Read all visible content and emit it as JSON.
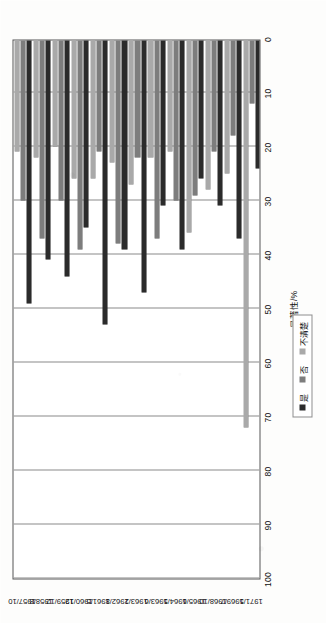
{
  "chart_data": {
    "type": "bar",
    "orientation": "horizontal",
    "title": "",
    "xlabel": "显著性/%",
    "ylabel": "",
    "ylim": [
      0,
      100
    ],
    "grid": true,
    "legend_position": "bottom-right",
    "categories": [
      "1957/10",
      "1958/8",
      "1959/12",
      "1960/12",
      "1961/5",
      "1962/8",
      "1963/2",
      "1963/6",
      "1964/5",
      "1965/6",
      "1968/10",
      "1969/7",
      "1971/5"
    ],
    "series": [
      {
        "name": "是",
        "color": "#2b2b2b",
        "values": [
          49,
          41,
          44,
          35,
          53,
          39,
          47,
          31,
          39,
          26,
          31,
          37,
          24
        ]
      },
      {
        "name": "否",
        "color": "#7d7d7d",
        "values": [
          30,
          37,
          30,
          39,
          21,
          38,
          22,
          37,
          30,
          29,
          21,
          18,
          12
        ]
      },
      {
        "name": "不清楚",
        "color": "#a9a9a9",
        "values": [
          21,
          22,
          20,
          26,
          26,
          23,
          27,
          22,
          21,
          36,
          28,
          25,
          72
        ]
      }
    ],
    "value_ticks": [
      100,
      90,
      80,
      70,
      60,
      50,
      40,
      30,
      20,
      10,
      0
    ]
  },
  "legend": {
    "items": [
      {
        "label": "是",
        "color": "#2b2b2b",
        "swatch": "square-swatch"
      },
      {
        "label": "否",
        "color": "#7d7d7d",
        "swatch": "square-swatch"
      },
      {
        "label": "不清楚",
        "color": "#a9a9a9",
        "swatch": "square-swatch"
      }
    ]
  }
}
